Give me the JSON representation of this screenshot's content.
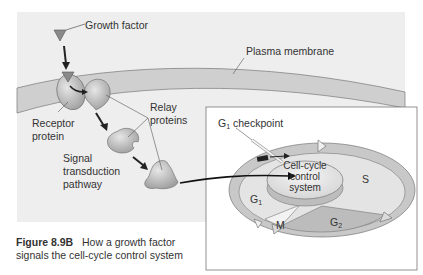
{
  "diagram": {
    "labels": {
      "growth_factor": "Growth factor",
      "plasma_membrane": "Plasma membrane",
      "receptor_protein_line1": "Receptor",
      "receptor_protein_line2": "protein",
      "relay_proteins_line1": "Relay",
      "relay_proteins_line2": "proteins",
      "signal_line1": "Signal",
      "signal_line2": "transduction",
      "signal_line3": "pathway",
      "checkpoint_main": "G",
      "checkpoint_sub": "1",
      "checkpoint_rest": " checkpoint",
      "control_line1": "Cell-cycle",
      "control_line2": "control",
      "control_line3": "system",
      "phase_s": "S",
      "phase_g1_main": "G",
      "phase_g1_sub": "1",
      "phase_g2_main": "G",
      "phase_g2_sub": "2",
      "phase_m": "M"
    },
    "caption": {
      "figure_number": "Figure 8.9B",
      "line1_text": "How a growth factor",
      "line2_text": "signals the cell-cycle control system"
    },
    "colors": {
      "background_panel": "#eeeeee",
      "membrane": "#cfcfcf",
      "protein": "#bdbdbd",
      "growth_factor": "#8a8a8a",
      "ring": "#c8c8c8",
      "checkpoint_bar": "#222222"
    }
  }
}
